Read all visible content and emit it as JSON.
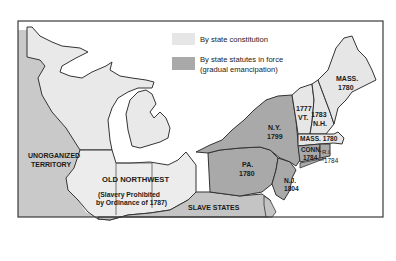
{
  "map": {
    "colors": {
      "background": "#ffffff",
      "frame": "#3a3a3a",
      "state_constitution": "#e6e6e6",
      "state_statutes": "#a9a9a9",
      "old_northwest": "#ececec",
      "slave_states": "#c4c4c4",
      "unorganized_territory": "#c9c9c9",
      "water": "#ffffff",
      "border": "#333333"
    },
    "legend": {
      "items": [
        {
          "label": "By state constitution",
          "swatch": "light-gray"
        },
        {
          "label_line1": "By state statutes in force",
          "label_line2": "(gradual emancipation)",
          "swatch": "dark-gray"
        }
      ]
    },
    "regions": {
      "unorganized_territory": {
        "line1": "UNORGANIZED",
        "line2": "TERRITORY"
      },
      "old_northwest": {
        "title": "OLD NORTHWEST",
        "note_line1": "(Slavery Prohibited",
        "note_line2": "by Ordinance of 1787)"
      },
      "slave_states": {
        "label": "SLAVE STATES"
      }
    },
    "states": {
      "mass_maine": {
        "abbr": "MASS.",
        "year": "1780"
      },
      "vt": {
        "abbr": "VT.",
        "year": "1777"
      },
      "nh": {
        "abbr": "N.H.",
        "year": "1783"
      },
      "ny": {
        "abbr": "N.Y.",
        "year": "1799"
      },
      "mass": {
        "abbr": "MASS.",
        "year": "1780",
        "full": "MASS. 1780"
      },
      "conn": {
        "abbr": "CONN.",
        "year": "1784"
      },
      "ri": {
        "abbr": "R.I.",
        "year": "1784"
      },
      "pa": {
        "abbr": "PA.",
        "year": "1780"
      },
      "nj": {
        "abbr": "N.J.",
        "year": "1804"
      }
    }
  }
}
